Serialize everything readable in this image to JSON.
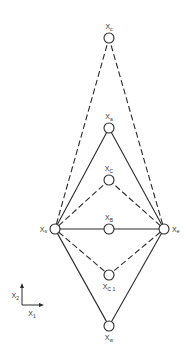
{
  "diagram": {
    "colors": {
      "stroke": "#2a2a2a",
      "background": "#ffffff"
    },
    "nodes": [
      {
        "id": "xc_top",
        "label": "X",
        "sub": "c",
        "x": 109,
        "y": 38
      },
      {
        "id": "xa",
        "label": "X",
        "sub": "a",
        "x": 109,
        "y": 128
      },
      {
        "id": "xc",
        "label": "X",
        "sub": "C",
        "x": 109,
        "y": 180
      },
      {
        "id": "xs",
        "label": "X",
        "sub": "s",
        "x": 55,
        "y": 229
      },
      {
        "id": "xb",
        "label": "X",
        "sub": "B",
        "x": 109,
        "y": 229
      },
      {
        "id": "xe",
        "label": "X",
        "sub": "e",
        "x": 164,
        "y": 229
      },
      {
        "id": "xc1",
        "label": "X",
        "sub": "C 1",
        "x": 109,
        "y": 275
      },
      {
        "id": "xw",
        "label": "X",
        "sub": "w",
        "x": 109,
        "y": 326
      }
    ],
    "edges": [
      {
        "from": "xs",
        "to": "xc_top",
        "style": "dashed"
      },
      {
        "from": "xe",
        "to": "xc_top",
        "style": "dashed"
      },
      {
        "from": "xs",
        "to": "xa",
        "style": "solid"
      },
      {
        "from": "xe",
        "to": "xa",
        "style": "solid"
      },
      {
        "from": "xs",
        "to": "xc",
        "style": "dashed"
      },
      {
        "from": "xe",
        "to": "xc",
        "style": "dashed"
      },
      {
        "from": "xs",
        "to": "xb",
        "style": "solid"
      },
      {
        "from": "xb",
        "to": "xe",
        "style": "solid"
      },
      {
        "from": "xs",
        "to": "xc1",
        "style": "dashed"
      },
      {
        "from": "xe",
        "to": "xc1",
        "style": "dashed"
      },
      {
        "from": "xs",
        "to": "xw",
        "style": "solid"
      },
      {
        "from": "xe",
        "to": "xw",
        "style": "solid"
      }
    ],
    "axes": {
      "origin": {
        "x": 22,
        "y": 305
      },
      "x_axis": {
        "label": "X",
        "sub": "1"
      },
      "y_axis": {
        "label": "X",
        "sub": "2"
      }
    }
  }
}
